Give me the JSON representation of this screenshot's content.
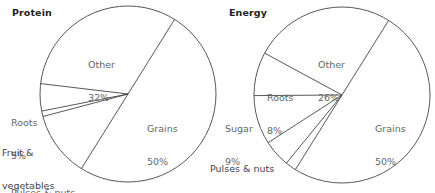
{
  "chart_data": [
    {
      "type": "pie",
      "title": "Protein",
      "categories": [
        "Grains",
        "Pulses & nuts",
        "Fruit & vegetables",
        "Roots",
        "Other"
      ],
      "values": [
        50,
        12,
        1,
        5,
        32
      ],
      "labels": {
        "grains": {
          "name": "Grains",
          "pct": "50%"
        },
        "pulses": {
          "name": "Pulses & nuts",
          "pct": "12%"
        },
        "fruit": {
          "name1": "Fruit &",
          "name2": "vegetables",
          "pct": "1%"
        },
        "roots": {
          "name": "Roots",
          "pct": "5%"
        },
        "other": {
          "name": "Other",
          "pct": "32%"
        }
      },
      "legend": "none (direct labels)",
      "colors": {
        "fill": "#ffffff",
        "stroke": "#444444"
      }
    },
    {
      "type": "pie",
      "title": "Energy",
      "categories": [
        "Grains",
        "Fruit & vegetables",
        "Pulses & nuts",
        "Sugar",
        "Roots",
        "Other"
      ],
      "values": [
        50,
        2,
        5,
        9,
        8,
        26
      ],
      "labels": {
        "grains": {
          "name": "Grains",
          "pct": "50%"
        },
        "fruit": {
          "name": "Fruit & vegetables",
          "pct": "2%"
        },
        "pulses": {
          "name": "Pulses & nuts",
          "pct": "5%"
        },
        "sugar": {
          "name": "Sugar",
          "pct": "9%"
        },
        "roots": {
          "name": "Roots",
          "pct": "8%"
        },
        "other": {
          "name": "Other",
          "pct": "26%"
        }
      },
      "legend": "none (direct labels)",
      "colors": {
        "fill": "#ffffff",
        "stroke": "#444444"
      }
    }
  ]
}
